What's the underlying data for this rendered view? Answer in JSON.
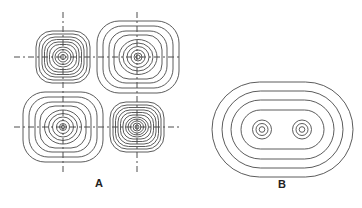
{
  "figure": {
    "panels": [
      {
        "id": "A",
        "label": "A",
        "description": "Four rounded-square concentric contour patterns arranged in a 2x2 grid with crossing dashed axis lines",
        "quadrants": [
          {
            "name": "top-left",
            "center": [
              63,
              57
            ],
            "half_w": 27,
            "half_h": 26,
            "rings": 10,
            "density": "tight"
          },
          {
            "name": "top-right",
            "center": [
              138,
              57
            ],
            "half_w": 41,
            "half_h": 36,
            "rings": 9,
            "density": "wide"
          },
          {
            "name": "bottom-left",
            "center": [
              63,
              127
            ],
            "half_w": 40,
            "half_h": 35,
            "rings": 9,
            "density": "wide"
          },
          {
            "name": "bottom-right",
            "center": [
              137,
              127
            ],
            "half_w": 27,
            "half_h": 25,
            "rings": 11,
            "density": "tight"
          }
        ]
      },
      {
        "id": "B",
        "label": "B",
        "description": "Nested stadium (rounded-rectangle) contours enclosing two small concentric circle groups",
        "center": [
          282,
          129
        ],
        "stadiums": 4,
        "inner_groups": [
          {
            "center": [
              262,
              129
            ],
            "rings": 3
          },
          {
            "center": [
              302,
              129
            ],
            "rings": 3
          }
        ]
      }
    ]
  }
}
